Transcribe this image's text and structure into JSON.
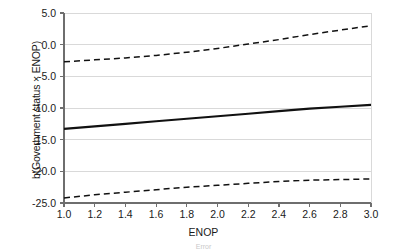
{
  "figure": {
    "axis_title_x": "ENOP",
    "axis_title_y": "b(Government status × ENOP)",
    "caption": "Error"
  },
  "chart_data": {
    "type": "line",
    "title": "",
    "xlabel": "ENOP",
    "ylabel": "b(Government status × ENOP)",
    "xlim": [
      1.0,
      3.0
    ],
    "ylim": [
      -25.0,
      5.0
    ],
    "xticks": [
      "1.0",
      "1.2",
      "1.4",
      "1.6",
      "1.8",
      "2.0",
      "2.2",
      "2.4",
      "2.6",
      "2.8",
      "3.0"
    ],
    "xtick_values": [
      1.0,
      1.2,
      1.4,
      1.6,
      1.8,
      2.0,
      2.2,
      2.4,
      2.6,
      2.8,
      3.0
    ],
    "yticks": [
      "5.0",
      "0.0",
      "-5.0",
      "-10.0",
      "-15.0",
      "-20.0",
      "-25.0"
    ],
    "ytick_values": [
      5.0,
      0.0,
      -5.0,
      -10.0,
      -15.0,
      -20.0,
      -25.0
    ],
    "grid": "horizontal",
    "legend": "none",
    "series": [
      {
        "name": "upper-confidence-bound",
        "style": "dashed",
        "color": "#111111",
        "x": [
          1.0,
          1.2,
          1.4,
          1.6,
          1.8,
          2.0,
          2.2,
          2.4,
          2.6,
          2.8,
          3.0
        ],
        "values": [
          -2.7,
          -2.4,
          -2.1,
          -1.7,
          -1.2,
          -0.6,
          0.1,
          0.8,
          1.6,
          2.3,
          3.0
        ]
      },
      {
        "name": "marginal-effect",
        "style": "solid",
        "color": "#111111",
        "x": [
          1.0,
          1.2,
          1.4,
          1.6,
          1.8,
          2.0,
          2.2,
          2.4,
          2.6,
          2.8,
          3.0
        ],
        "values": [
          -13.3,
          -12.9,
          -12.5,
          -12.1,
          -11.7,
          -11.3,
          -10.9,
          -10.5,
          -10.1,
          -9.8,
          -9.5
        ]
      },
      {
        "name": "lower-confidence-bound",
        "style": "dashed",
        "color": "#111111",
        "x": [
          1.0,
          1.2,
          1.4,
          1.6,
          1.8,
          2.0,
          2.2,
          2.4,
          2.6,
          2.8,
          3.0
        ],
        "values": [
          -24.2,
          -23.7,
          -23.3,
          -22.9,
          -22.5,
          -22.2,
          -21.9,
          -21.6,
          -21.4,
          -21.3,
          -21.2
        ]
      }
    ],
    "colors": {
      "gridline": "#d9d9d9",
      "axis": "#6e6e6e",
      "line": "#111111",
      "background": "#ffffff"
    }
  }
}
